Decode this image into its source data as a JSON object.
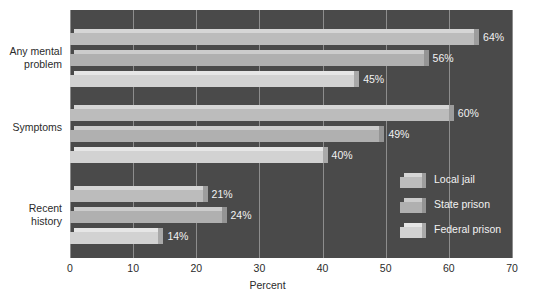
{
  "chart_data": {
    "type": "bar",
    "orientation": "horizontal",
    "title": "",
    "xlabel": "Percent",
    "ylabel": "",
    "xlim": [
      0,
      70
    ],
    "xticks": [
      0,
      10,
      20,
      30,
      40,
      50,
      60,
      70
    ],
    "xtick_labels": [
      "0",
      "10",
      "20",
      "30",
      "40",
      "50",
      "60",
      "70"
    ],
    "grid": true,
    "legend_position": "bottom-right-inside",
    "categories": [
      "Any mental problem",
      "Symptoms",
      "Recent history"
    ],
    "category_labels": [
      "Any mental\nproblem",
      "Symptoms",
      "Recent\nhistory"
    ],
    "series": [
      {
        "name": "Local jail",
        "values": [
          64,
          60,
          21
        ],
        "value_labels": [
          "64%",
          "60%",
          "21%"
        ],
        "color": "#bcbcbc"
      },
      {
        "name": "State prison",
        "values": [
          56,
          49,
          24
        ],
        "value_labels": [
          "56%",
          "49%",
          "24%"
        ],
        "color": "#b0b0b0"
      },
      {
        "name": "Federal prison",
        "values": [
          45,
          40,
          14
        ],
        "value_labels": [
          "45%",
          "40%",
          "14%"
        ],
        "color": "#d2d2d2"
      }
    ]
  },
  "colors": {
    "plot_background": "#4a4a4a",
    "page_background": "#ffffff",
    "gridline": "#8d8d8d",
    "axis_text": "#2b2b2b",
    "value_text": "#f2f2f2"
  },
  "legend": {
    "items": [
      {
        "label": "Local jail"
      },
      {
        "label": "State prison"
      },
      {
        "label": "Federal prison"
      }
    ]
  },
  "axis": {
    "x_title": "Percent"
  }
}
